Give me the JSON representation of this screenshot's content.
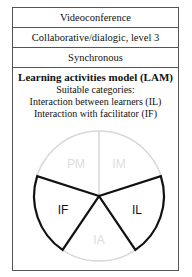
{
  "rows": [
    {
      "label": "Videoconference"
    },
    {
      "label": "Collaborative/dialogic, level 3"
    },
    {
      "label": "Synchronous"
    }
  ],
  "lam": {
    "title": "Learning activities model (LAM)",
    "subtitle": "Suitable categories:",
    "categories": [
      "Interaction between learners (IL)",
      "Interaction with facilitator (IF)"
    ]
  },
  "pie": {
    "sectors": [
      {
        "id": "PM",
        "label": "PM",
        "highlighted": false
      },
      {
        "id": "IM",
        "label": "IM",
        "highlighted": false
      },
      {
        "id": "IL",
        "label": "IL",
        "highlighted": true
      },
      {
        "id": "IA",
        "label": "IA",
        "highlighted": false
      },
      {
        "id": "IF",
        "label": "IF",
        "highlighted": true
      }
    ],
    "colors": {
      "highlight": "#111111",
      "faded": "#d8d8d8",
      "faded_text": "#dddddd"
    }
  }
}
